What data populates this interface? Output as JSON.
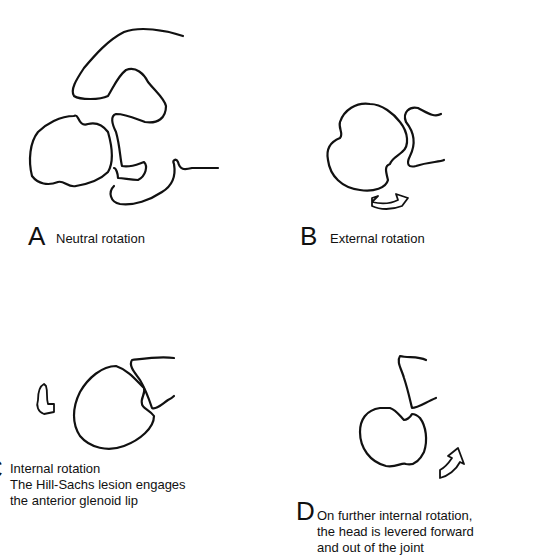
{
  "panels": [
    {
      "id": "A",
      "letter": "A",
      "caption": "Neutral rotation"
    },
    {
      "id": "B",
      "letter": "B",
      "caption": "External rotation"
    },
    {
      "id": "C",
      "letter": "C",
      "caption_lines": [
        "Internal rotation",
        "The Hill-Sachs lesion engages",
        "the anterior glenoid lip"
      ]
    },
    {
      "id": "D",
      "letter": "D",
      "caption_lines": [
        "On further internal rotation,",
        "the head is levered forward",
        "and out of the joint"
      ]
    }
  ],
  "colors": {
    "line": "#111111",
    "background": "#ffffff"
  }
}
